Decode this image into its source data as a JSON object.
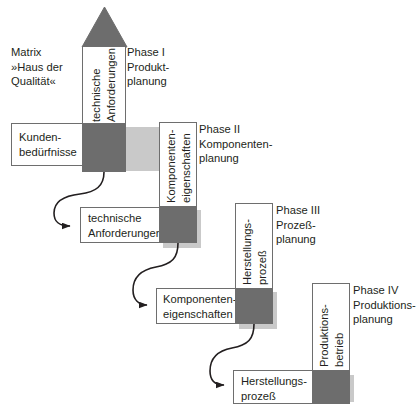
{
  "diagram": {
    "matrix_caption": "Matrix\n»Haus der\nQualität«",
    "colors": {
      "gray_fill": "#6d6d6d",
      "outline": "#6e6e6e",
      "shadow": "#c9c9c9",
      "text": "#231f20",
      "background": "#ffffff"
    },
    "phases": [
      {
        "id": "phase-1",
        "label": "Phase I\nProdukt-\nplanung"
      },
      {
        "id": "phase-2",
        "label": "Phase II\nKomponenten-\nplanung"
      },
      {
        "id": "phase-3",
        "label": "Phase III\nProzeß-\nplanung"
      },
      {
        "id": "phase-4",
        "label": "Phase IV\nProduktions-\nplanung"
      }
    ],
    "vertical_columns": [
      {
        "id": "col-1",
        "label": "technische\nAnforderungen",
        "has_roof": true
      },
      {
        "id": "col-2",
        "label": "Komponenten-\neigenschaften",
        "has_roof": false
      },
      {
        "id": "col-3",
        "label": "Herstellungs-\nprozeß",
        "has_roof": false
      },
      {
        "id": "col-4",
        "label": "Produktions-\nbetrieb",
        "has_roof": false
      }
    ],
    "horizontal_rows": [
      {
        "id": "row-1",
        "label": "Kunden-\nbedürfnisse"
      },
      {
        "id": "row-2",
        "label": "technische\nAnforderungen"
      },
      {
        "id": "row-3",
        "label": "Komponenten-\neigenschaften"
      },
      {
        "id": "row-4",
        "label": "Herstellungs-\nprozeß"
      }
    ],
    "flow_arrows": [
      {
        "id": "arrow-1",
        "from": "matrix-1-intersection",
        "to": "row-2"
      },
      {
        "id": "arrow-2",
        "from": "matrix-2-intersection",
        "to": "row-3"
      },
      {
        "id": "arrow-3",
        "from": "matrix-3-intersection",
        "to": "row-4"
      }
    ]
  }
}
